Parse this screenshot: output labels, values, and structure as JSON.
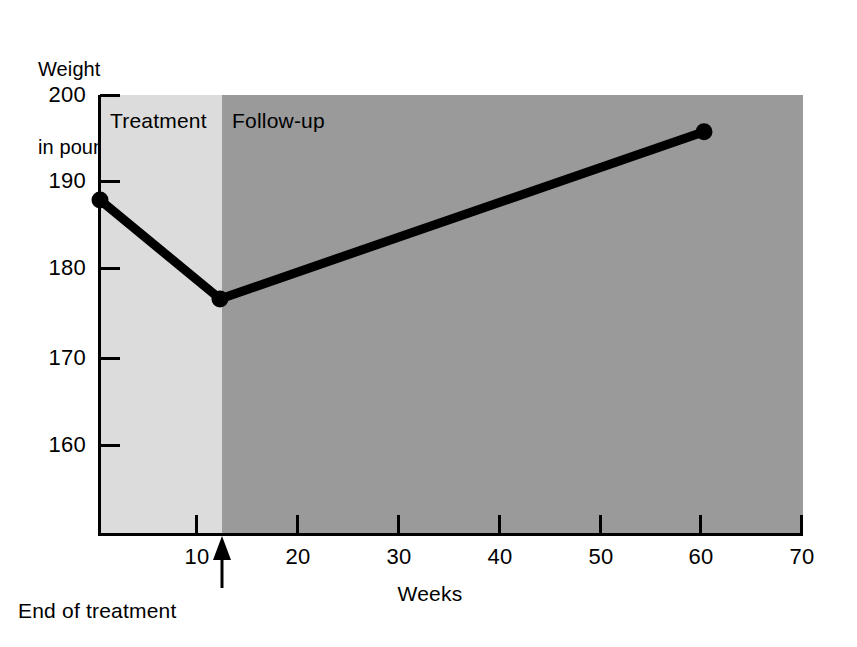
{
  "chart_data": {
    "type": "line",
    "title": "",
    "subtitle": "",
    "xlabel": "Weeks",
    "ylabel": "Weight\nin pounds",
    "ylabel_lines": [
      "Weight",
      "in pounds"
    ],
    "xlim": [
      0,
      70
    ],
    "ylim": [
      155.2,
      200
    ],
    "grid": false,
    "legend": "none",
    "x_ticks": [
      10,
      20,
      30,
      40,
      50,
      60,
      70
    ],
    "x_tick_labels": [
      "10",
      "20",
      "30",
      "40",
      "50",
      "60",
      "70"
    ],
    "y_ticks": [
      160,
      170,
      180,
      190,
      200
    ],
    "y_tick_labels": [
      "160",
      "170",
      "180",
      "190",
      "200"
    ],
    "series": [
      {
        "name": "Mean weight",
        "color": "#000000",
        "marker": "circle",
        "x": [
          0,
          12,
          60.4
        ],
        "y": [
          188.0,
          176.7,
          195.8
        ],
        "points": [
          {
            "week": 0,
            "weight": 188.0
          },
          {
            "week": 12,
            "weight": 176.7
          },
          {
            "week": 60.4,
            "weight": 195.8
          }
        ]
      }
    ],
    "bands": [
      {
        "name": "Treatment",
        "label": "Treatment",
        "x_start": 0,
        "x_end": 12,
        "color": "#dcdcdc"
      },
      {
        "name": "Follow-up",
        "label": "Follow-up",
        "x_start": 12,
        "x_end": 69,
        "color": "#9a9a9a"
      }
    ],
    "annotations": [
      {
        "name": "end-of-treatment",
        "text": "End of treatment",
        "x": 12,
        "arrow": "up"
      }
    ]
  },
  "axis": {
    "y_title_line1": "Weight",
    "y_title_line2": "in pounds",
    "x_title": "Weeks"
  },
  "bands": {
    "treatment_label": "Treatment",
    "followup_label": "Follow-up",
    "treatment_color": "#dcdcdc",
    "followup_color": "#9a9a9a"
  },
  "annotation": {
    "end_of_treatment": "End of treatment"
  },
  "ticks": {
    "y": [
      "200",
      "190",
      "180",
      "170",
      "160"
    ],
    "x": [
      "10",
      "20",
      "30",
      "40",
      "50",
      "60",
      "70"
    ]
  },
  "colors": {
    "series": "#000000",
    "axis": "#000000",
    "background": "#ffffff"
  }
}
